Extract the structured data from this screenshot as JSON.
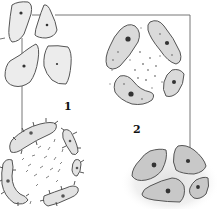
{
  "diagram": {
    "labels": [
      {
        "id": "label-1",
        "text": "1",
        "x": 64,
        "y": 101
      },
      {
        "id": "label-2",
        "text": "2",
        "x": 133,
        "y": 124
      }
    ],
    "groups": [
      {
        "name": "polygonal-cells-cluster",
        "description": "four separate polygonal cells with central nuclei",
        "position": "top-left"
      },
      {
        "name": "ring-cluster-elongated-cells",
        "description": "four elongated cells arranged in a ring with scattered granules",
        "position": "top-right"
      },
      {
        "name": "ring-cluster-spiked-cells",
        "description": "four curved cells with spiky projections arranged in a ring, scattered fibres in center",
        "position": "bottom-left"
      },
      {
        "name": "grouped-dense-cells",
        "description": "four gray cells with dark nuclei embedded in granular matrix",
        "position": "bottom-right"
      }
    ],
    "colors": {
      "outline": "#555555",
      "light_cell_fill": "#ececec",
      "mid_cell_fill": "#d6d6d6",
      "dark_cell_fill": "#c4c4c4",
      "nucleus": "#333333",
      "line": "#666666"
    }
  }
}
